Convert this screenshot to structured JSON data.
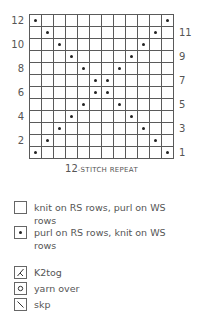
{
  "chart_data": {
    "type": "table",
    "caption": {
      "number": "12",
      "text": "-STITCH REPEAT",
      "full": "12-stitch repeat"
    },
    "columns": 12,
    "rows": 12,
    "left_row_labels": [
      "12",
      "10",
      "8",
      "6",
      "4",
      "2"
    ],
    "right_row_labels": [
      "11",
      "9",
      "7",
      "5",
      "3",
      "1"
    ],
    "grid_rows_top_to_bottom": [
      {
        "row": 12,
        "purl_cols": [
          0,
          11
        ]
      },
      {
        "row": 11,
        "purl_cols": [
          1,
          10
        ]
      },
      {
        "row": 10,
        "purl_cols": [
          2,
          9
        ]
      },
      {
        "row": 9,
        "purl_cols": [
          3,
          8
        ]
      },
      {
        "row": 8,
        "purl_cols": [
          4,
          7
        ]
      },
      {
        "row": 7,
        "purl_cols": [
          5,
          6
        ]
      },
      {
        "row": 6,
        "purl_cols": [
          5,
          6
        ]
      },
      {
        "row": 5,
        "purl_cols": [
          4,
          7
        ]
      },
      {
        "row": 4,
        "purl_cols": [
          3,
          8
        ]
      },
      {
        "row": 3,
        "purl_cols": [
          2,
          9
        ]
      },
      {
        "row": 2,
        "purl_cols": [
          1,
          10
        ]
      },
      {
        "row": 1,
        "purl_cols": [
          0,
          11
        ]
      }
    ]
  },
  "legend": {
    "items": [
      {
        "symbol": "empty-square-icon",
        "label": "knit on RS rows, purl on WS rows"
      },
      {
        "symbol": "dot-square-icon",
        "label": "purl on RS rows, knit on WS rows"
      },
      {
        "symbol": "k2tog-icon",
        "label": "K2tog"
      },
      {
        "symbol": "yarn-over-icon",
        "label": "yarn over"
      },
      {
        "symbol": "skp-icon",
        "label": "skp"
      }
    ]
  },
  "colors": {
    "grid_line": "#5a5a5a",
    "dot": "#222222",
    "text": "#555555",
    "background": "#ffffff"
  }
}
